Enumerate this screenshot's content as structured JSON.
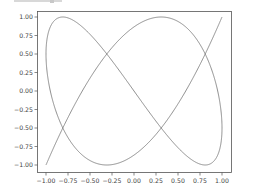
{
  "chart_data": {
    "type": "line",
    "title": "",
    "xlabel": "",
    "ylabel": "",
    "xlim": [
      -1.1,
      1.1
    ],
    "ylim": [
      -1.1,
      1.1
    ],
    "grid": false,
    "legend": null,
    "series": [
      {
        "name": "lissajous",
        "color": "#808080",
        "parametric": "x = -cos(3t), y = -cos(5t), t in [0, pi]",
        "freq_x": 3,
        "freq_y": 5,
        "start": [
          -1.0,
          -1.0
        ],
        "end": [
          1.0,
          1.0
        ]
      }
    ],
    "xticks": [
      "-1.00",
      "-0.75",
      "-0.50",
      "-0.25",
      "0.00",
      "0.25",
      "0.50",
      "0.75",
      "1.00"
    ],
    "yticks": [
      "1.00",
      "0.75",
      "0.50",
      "0.25",
      "0.00",
      "-0.25",
      "-0.50",
      "-0.75",
      "-1.00"
    ],
    "xtick_values": [
      -1.0,
      -0.75,
      -0.5,
      -0.25,
      0.0,
      0.25,
      0.5,
      0.75,
      1.0
    ],
    "ytick_values": [
      1.0,
      0.75,
      0.5,
      0.25,
      0.0,
      -0.25,
      -0.5,
      -0.75,
      -1.0
    ]
  },
  "colors": {
    "line": "#808080",
    "axes": "#555555",
    "text": "#444444",
    "background": "#ffffff"
  }
}
